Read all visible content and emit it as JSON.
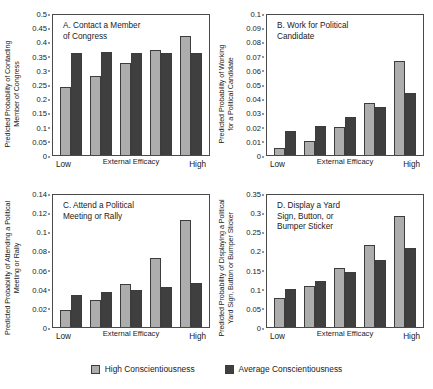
{
  "chart_data": [
    {
      "type": "bar",
      "panel": "A",
      "title": "A. Contact a Member\nof Congress",
      "ylabel": "Predicted Probability of Contacting\nMember of Congress",
      "xlabel": "External Efficacy",
      "categories": [
        "Low",
        "2",
        "3",
        "4",
        "High"
      ],
      "xtick_labels": {
        "low": "Low",
        "mid": "External Efficacy",
        "high": "High"
      },
      "ylim": [
        0,
        0.5
      ],
      "yticks": [
        "0.5",
        "0.45",
        "0.4",
        "0.35",
        "0.3",
        "0.25",
        "0.2",
        "0.15",
        "0.1",
        "0.05",
        "0"
      ],
      "grid": false,
      "series": [
        {
          "name": "High Conscientiousness",
          "values": [
            0.243,
            0.283,
            0.329,
            0.374,
            0.425
          ]
        },
        {
          "name": "Average Conscientiousness",
          "values": [
            0.366,
            0.367,
            0.365,
            0.363,
            0.363
          ]
        }
      ]
    },
    {
      "type": "bar",
      "panel": "B",
      "title": "B. Work for Political\nCandidate",
      "ylabel": "Predicted Probability of Working\nfor a Political Candidate",
      "xlabel": "External Efficacy",
      "categories": [
        "Low",
        "2",
        "3",
        "4",
        "High"
      ],
      "xtick_labels": {
        "low": "Low",
        "mid": "External Efficacy",
        "high": "High"
      },
      "ylim": [
        0,
        0.1
      ],
      "yticks": [
        "0.1",
        "0.09",
        "0.08",
        "0.07",
        "0.06",
        "0.05",
        "0.04",
        "0.03",
        "0.02",
        "0.01",
        "0"
      ],
      "grid": false,
      "series": [
        {
          "name": "High Conscientiousness",
          "values": [
            0.005,
            0.01,
            0.02,
            0.037,
            0.067
          ]
        },
        {
          "name": "Average Conscientiousness",
          "values": [
            0.017,
            0.021,
            0.027,
            0.034,
            0.044
          ]
        }
      ]
    },
    {
      "type": "bar",
      "panel": "C",
      "title": "C. Attend a Political\nMeeting or Rally",
      "ylabel": "Predicted Probability of Attending a Political\nMeeting or Rally",
      "xlabel": "External Efficacy",
      "categories": [
        "Low",
        "2",
        "3",
        "4",
        "High"
      ],
      "xtick_labels": {
        "low": "Low",
        "mid": "External Efficacy",
        "high": "High"
      },
      "ylim": [
        0,
        0.14
      ],
      "yticks": [
        "0.14",
        "0.12",
        "0.1",
        "0.08",
        "0.06",
        "0.04",
        "0.02",
        "0"
      ],
      "grid": false,
      "series": [
        {
          "name": "High Conscientiousness",
          "values": [
            0.018,
            0.029,
            0.046,
            0.073,
            0.113
          ]
        },
        {
          "name": "Average Conscientiousness",
          "values": [
            0.034,
            0.037,
            0.039,
            0.042,
            0.047
          ]
        }
      ]
    },
    {
      "type": "bar",
      "panel": "D",
      "title": "D. Display a Yard\nSign, Button, or\nBumper Sticker",
      "ylabel": "Predicted Probability of Displaying a Political\nYard Sign, Button or Bumper Sticker",
      "xlabel": "External Efficacy",
      "categories": [
        "Low",
        "2",
        "3",
        "4",
        "High"
      ],
      "xtick_labels": {
        "low": "Low",
        "mid": "External Efficacy",
        "high": "High"
      },
      "ylim": [
        0,
        0.35
      ],
      "yticks": [
        "0.35",
        "0.3",
        "0.25",
        "0.2",
        "0.15",
        "0.1",
        "0.05",
        "0"
      ],
      "grid": false,
      "series": [
        {
          "name": "High Conscientiousness",
          "values": [
            0.078,
            0.11,
            0.157,
            0.217,
            0.295
          ]
        },
        {
          "name": "Average Conscientiousness",
          "values": [
            0.1,
            0.121,
            0.147,
            0.177,
            0.21
          ]
        }
      ]
    }
  ],
  "legend": {
    "position": "bottom-center",
    "items": [
      {
        "label": "High Conscientiousness",
        "color": "#adadad"
      },
      {
        "label": "Average Conscientiousness",
        "color": "#3f3f3f"
      }
    ]
  },
  "colors": {
    "high_conscientiousness": "#adadad",
    "average_conscientiousness": "#3f3f3f",
    "axis": "#4a4a4a",
    "background": "#ffffff"
  }
}
